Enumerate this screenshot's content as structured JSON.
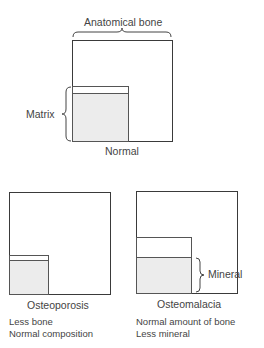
{
  "diagram": {
    "normal": {
      "top_label": "Anatomical bone",
      "side_label": "Matrix",
      "caption": "Normal"
    },
    "osteoporosis": {
      "caption": "Osteoporosis",
      "notes": [
        "Less bone",
        "Normal composition"
      ]
    },
    "osteomalacia": {
      "caption": "Osteomalacia",
      "side_label": "Mineral",
      "notes": [
        "Normal amount of bone",
        "Less mineral"
      ]
    }
  },
  "colors": {
    "outline": "#3a3a3a",
    "mineral_fill": "#ececec",
    "text": "#444444"
  }
}
